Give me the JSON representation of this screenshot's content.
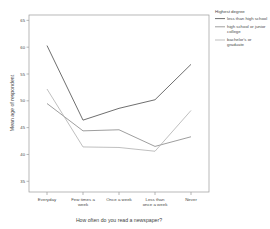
{
  "chart_data": {
    "type": "line",
    "title": "",
    "xlabel": "How often do you read a newspaper?",
    "ylabel": "Mean age of respondent",
    "categories": [
      "Everyday",
      "Few times a week",
      "Once a week",
      "Less than once a week",
      "Never"
    ],
    "category_lines": [
      [
        "Everyday"
      ],
      [
        "Few times a",
        "week"
      ],
      [
        "Once a week"
      ],
      [
        "Less than",
        "once a week"
      ],
      [
        "Never"
      ]
    ],
    "ylim": [
      33,
      66
    ],
    "yticks": [
      35,
      40,
      45,
      50,
      55,
      60,
      65
    ],
    "ytick_labels": [
      "35",
      "40",
      "45",
      "50",
      "55",
      "60",
      "65"
    ],
    "grid": false,
    "legend_position": "right",
    "legend_title": "Highest degree",
    "series": [
      {
        "name": "less than high school",
        "name_lines": [
          "less than high school"
        ],
        "color": "#555555",
        "values": [
          60.3,
          46.4,
          48.6,
          50.2,
          56.8
        ]
      },
      {
        "name": "high school or junior college",
        "name_lines": [
          "high school or junior",
          "college"
        ],
        "color": "#8d8d8d",
        "values": [
          49.5,
          44.4,
          44.6,
          41.5,
          43.3
        ]
      },
      {
        "name": "bachelor's or graduate",
        "name_lines": [
          "bachelor's or",
          "graduate"
        ],
        "color": "#b4b4b4",
        "values": [
          52.2,
          41.4,
          41.3,
          40.6,
          48.2
        ]
      }
    ]
  },
  "colors": {
    "frame": "#9a9a9a",
    "background": "#ffffff",
    "text": "#4a4a4a"
  }
}
